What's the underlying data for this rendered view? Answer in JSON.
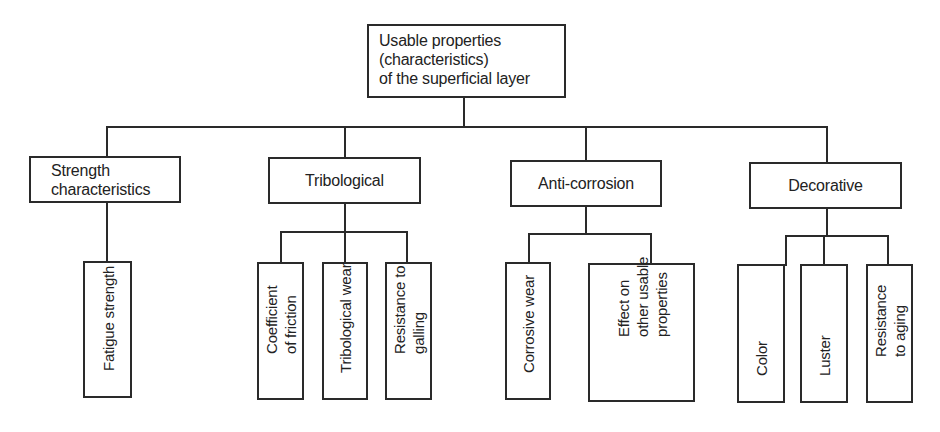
{
  "diagram": {
    "root": {
      "label": "Usable properties\n(characteristics)\nof the superficial layer"
    },
    "categories": [
      {
        "label": "Strength\ncharacteristics",
        "children": [
          {
            "label": "Fatigue strength"
          }
        ]
      },
      {
        "label": "Tribological",
        "children": [
          {
            "label": "Coefficient\nof friction"
          },
          {
            "label": "Tribological wear"
          },
          {
            "label": "Resistance to\ngalling"
          }
        ]
      },
      {
        "label": "Anti-corrosion",
        "children": [
          {
            "label": "Corrosive wear"
          },
          {
            "label": "Effect on\nother usable\nproperties"
          }
        ]
      },
      {
        "label": "Decorative",
        "children": [
          {
            "label": "Color"
          },
          {
            "label": "Luster"
          },
          {
            "label": "Resistance\nto aging"
          }
        ]
      }
    ],
    "colors": {
      "line": "#2a2a2a",
      "text": "#222222",
      "background": "#ffffff"
    }
  }
}
